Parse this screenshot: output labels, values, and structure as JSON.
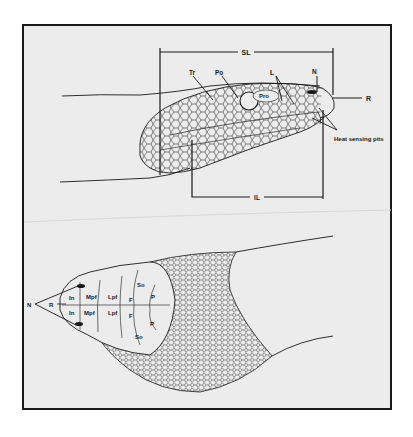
{
  "figure": {
    "lateral_view": {
      "brackets": {
        "supralabial": "SL",
        "infralabial": "IL"
      },
      "labels": {
        "temporal": "Tr",
        "postocular": "Po",
        "preocular": "Pro",
        "loreal": "L",
        "nasal": "N",
        "rostral": "R",
        "pits": "Heat sensing pits"
      }
    },
    "dorsal_view": {
      "labels": {
        "nasal": "N",
        "rostral": "R",
        "internasal_upper": "In",
        "internasal_lower": "In",
        "medial_prefrontal_upper": "Mpf",
        "medial_prefrontal_lower": "Mpf",
        "lateral_prefrontal_upper": "Lpf",
        "lateral_prefrontal_lower": "Lpf",
        "frontal_upper": "F",
        "frontal_lower": "F",
        "supraocular_upper": "So",
        "supraocular_lower": "So",
        "parietal_upper": "P",
        "parietal_lower": "P"
      }
    },
    "colors": {
      "background": "#ececec",
      "ink": "#1a1a1a",
      "frame": "#1a1a1a"
    }
  }
}
